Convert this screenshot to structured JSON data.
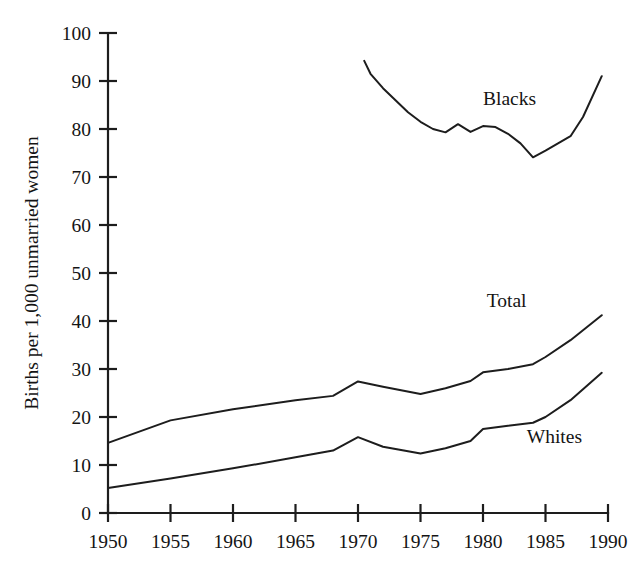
{
  "chart_data": {
    "type": "line",
    "title": "",
    "xlabel": "",
    "ylabel": "Births per 1,000 unmarried women",
    "xlim": [
      1950,
      1990
    ],
    "ylim": [
      0,
      100
    ],
    "ytick_labels": [
      "0",
      "10",
      "20",
      "30",
      "40",
      "50",
      "60",
      "70",
      "80",
      "90",
      "100"
    ],
    "yticks": [
      0,
      10,
      20,
      30,
      40,
      50,
      60,
      70,
      80,
      90,
      100
    ],
    "xtick_labels": [
      "1950",
      "1955",
      "1960",
      "1965",
      "1970",
      "1975",
      "1980",
      "1985",
      "1990"
    ],
    "xticks": [
      1950,
      1955,
      1960,
      1965,
      1970,
      1975,
      1980,
      1985,
      1990
    ],
    "grid": false,
    "legend": "inline-labels",
    "series": [
      {
        "name": "Blacks",
        "label_x": 1980.0,
        "label_y": 85.0,
        "x": [
          1970.5,
          1971,
          1972,
          1973,
          1974,
          1975,
          1976,
          1977,
          1978,
          1979,
          1980,
          1981,
          1982,
          1983,
          1984,
          1985,
          1986,
          1987,
          1988,
          1989.5
        ],
        "y": [
          94.2,
          91.5,
          88.5,
          86.0,
          83.5,
          81.5,
          80.0,
          79.3,
          81.0,
          79.4,
          80.6,
          80.4,
          79.0,
          77.0,
          74.1,
          75.5,
          77.0,
          78.5,
          82.5,
          91.0
        ]
      },
      {
        "name": "Total",
        "label_x": 1980.3,
        "label_y": 43.0,
        "x": [
          1950,
          1955,
          1960,
          1965,
          1968,
          1970,
          1972,
          1975,
          1977,
          1979,
          1980,
          1982,
          1984,
          1985,
          1987,
          1989.5
        ],
        "y": [
          14.6,
          19.3,
          21.6,
          23.5,
          24.4,
          27.4,
          26.3,
          24.8,
          26.0,
          27.5,
          29.3,
          30.0,
          31.0,
          32.5,
          36.0,
          41.2
        ]
      },
      {
        "name": "Whites",
        "label_x": 1983.5,
        "label_y": 14.5,
        "x": [
          1950,
          1955,
          1960,
          1965,
          1968,
          1970,
          1972,
          1975,
          1977,
          1979,
          1980,
          1982,
          1984,
          1985,
          1987,
          1989.5
        ],
        "y": [
          5.2,
          7.2,
          9.3,
          11.6,
          13.0,
          15.8,
          13.8,
          12.4,
          13.5,
          15.0,
          17.5,
          18.2,
          18.8,
          20.0,
          23.5,
          29.2
        ]
      }
    ]
  },
  "axis": {
    "y_title": "Births per 1,000 unmarried women"
  }
}
